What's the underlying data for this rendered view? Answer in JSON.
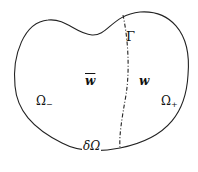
{
  "diagram": {
    "labels": {
      "gamma": "Γ",
      "w_bar": "w",
      "w": "w",
      "omega_minus": "Ω",
      "omega_minus_sub": "−",
      "omega_plus": "Ω",
      "omega_plus_sub": "+",
      "boundary": "δΩ"
    },
    "colors": {
      "stroke": "#222222",
      "background": "#ffffff"
    }
  }
}
